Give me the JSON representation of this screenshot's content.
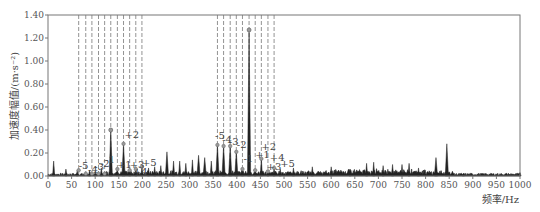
{
  "chart_data": {
    "type": "line",
    "title": "",
    "xlabel": "频率/Hz",
    "ylabel": "加速度幅值/(m·s⁻²)",
    "xlim": [
      0,
      1000
    ],
    "ylim": [
      0,
      1.4
    ],
    "x_ticks": [
      "0",
      "50",
      "100",
      "150",
      "200",
      "250",
      "300",
      "350",
      "400",
      "450",
      "500",
      "550",
      "600",
      "650",
      "700",
      "750",
      "800",
      "850",
      "900",
      "950",
      "1000"
    ],
    "y_ticks": [
      "0.00",
      "0.20",
      "0.40",
      "0.60",
      "0.80",
      "1.00",
      "1.20",
      "1.40"
    ],
    "grid": false,
    "legend": null,
    "line_color": "#222222",
    "dashed_line_color": "#777777",
    "series": [
      {
        "name": "spectrum",
        "peaks": [
          {
            "x": 12,
            "y": 0.13
          },
          {
            "x": 38,
            "y": 0.06
          },
          {
            "x": 62,
            "y": 0.05
          },
          {
            "x": 88,
            "y": 0.05
          },
          {
            "x": 100,
            "y": 0.04
          },
          {
            "x": 113,
            "y": 0.07
          },
          {
            "x": 133,
            "y": 0.4
          },
          {
            "x": 147,
            "y": 0.06
          },
          {
            "x": 160,
            "y": 0.28
          },
          {
            "x": 173,
            "y": 0.05
          },
          {
            "x": 186,
            "y": 0.06
          },
          {
            "x": 199,
            "y": 0.08
          },
          {
            "x": 213,
            "y": 0.07
          },
          {
            "x": 226,
            "y": 0.08
          },
          {
            "x": 239,
            "y": 0.09
          },
          {
            "x": 252,
            "y": 0.21
          },
          {
            "x": 266,
            "y": 0.13
          },
          {
            "x": 279,
            "y": 0.13
          },
          {
            "x": 292,
            "y": 0.11
          },
          {
            "x": 306,
            "y": 0.14
          },
          {
            "x": 319,
            "y": 0.18
          },
          {
            "x": 332,
            "y": 0.16
          },
          {
            "x": 346,
            "y": 0.13
          },
          {
            "x": 359,
            "y": 0.27
          },
          {
            "x": 372,
            "y": 0.26
          },
          {
            "x": 386,
            "y": 0.26
          },
          {
            "x": 399,
            "y": 0.21
          },
          {
            "x": 412,
            "y": 0.06
          },
          {
            "x": 426,
            "y": 1.27
          },
          {
            "x": 439,
            "y": 0.05
          },
          {
            "x": 452,
            "y": 0.15
          },
          {
            "x": 466,
            "y": 0.04
          },
          {
            "x": 479,
            "y": 0.07
          },
          {
            "x": 492,
            "y": 0.06
          },
          {
            "x": 520,
            "y": 0.07
          },
          {
            "x": 560,
            "y": 0.08
          },
          {
            "x": 600,
            "y": 0.08
          },
          {
            "x": 640,
            "y": 0.06
          },
          {
            "x": 675,
            "y": 0.11
          },
          {
            "x": 690,
            "y": 0.12
          },
          {
            "x": 710,
            "y": 0.09
          },
          {
            "x": 730,
            "y": 0.1
          },
          {
            "x": 750,
            "y": 0.1
          },
          {
            "x": 765,
            "y": 0.11
          },
          {
            "x": 785,
            "y": 0.07
          },
          {
            "x": 822,
            "y": 0.16
          },
          {
            "x": 845,
            "y": 0.28
          },
          {
            "x": 880,
            "y": 0.02
          },
          {
            "x": 1000,
            "y": 0.03
          }
        ]
      }
    ],
    "sideband_groups": [
      {
        "center_hz": 133,
        "dashed_lines_hz": [
          65,
          80,
          93,
          107,
          120,
          133,
          147,
          160,
          173,
          186,
          199
        ],
        "labels": [
          {
            "text": "-5",
            "x": 65,
            "y": 0.06
          },
          {
            "text": "-4",
            "x": 85,
            "y": 0.03
          },
          {
            "text": "-3",
            "x": 98,
            "y": 0.05
          },
          {
            "text": "-2",
            "x": 110,
            "y": 0.08
          },
          {
            "text": "-1",
            "x": 121,
            "y": 0.11
          },
          {
            "text": "+1",
            "x": 146,
            "y": 0.07
          },
          {
            "text": "+2",
            "x": 162,
            "y": 0.33
          },
          {
            "text": "+3",
            "x": 173,
            "y": 0.07
          },
          {
            "text": "+4",
            "x": 180,
            "y": 0.01
          },
          {
            "text": "+5",
            "x": 199,
            "y": 0.09
          }
        ]
      },
      {
        "center_hz": 426,
        "dashed_lines_hz": [
          359,
          372,
          386,
          399,
          412,
          426,
          439,
          452,
          466,
          479
        ],
        "labels": [
          {
            "text": "-5",
            "x": 354,
            "y": 0.32
          },
          {
            "text": "-4",
            "x": 369,
            "y": 0.29
          },
          {
            "text": "-3",
            "x": 383,
            "y": 0.27
          },
          {
            "text": "-2",
            "x": 400,
            "y": 0.24
          },
          {
            "text": "-1",
            "x": 414,
            "y": 0.12
          },
          {
            "text": "+1",
            "x": 439,
            "y": 0.16
          },
          {
            "text": "+2",
            "x": 452,
            "y": 0.23
          },
          {
            "text": "+3",
            "x": 463,
            "y": 0.05
          },
          {
            "text": "+4",
            "x": 470,
            "y": 0.13
          },
          {
            "text": "+5",
            "x": 492,
            "y": 0.08
          }
        ]
      }
    ]
  }
}
